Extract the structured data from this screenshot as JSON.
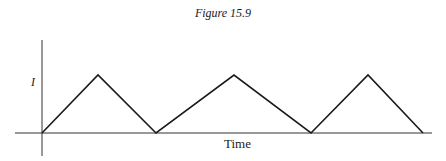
{
  "figure": {
    "title": "Figure 15.9"
  },
  "chart_data": {
    "type": "line",
    "title": "Figure 15.9",
    "xlabel": "Time",
    "ylabel": "I",
    "x": [
      0,
      56,
      114,
      192,
      269,
      326,
      381
    ],
    "y": [
      0,
      1,
      0,
      1,
      0,
      1,
      0
    ],
    "xlim": [
      -27,
      390
    ],
    "ylim": [
      -0.4,
      1.6
    ],
    "yticks_labels": [
      "I"
    ],
    "grid": false,
    "legend": null,
    "color": "#1a1a1a"
  }
}
